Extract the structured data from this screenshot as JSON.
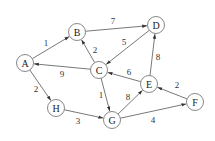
{
  "graph": {
    "nodes": [
      {
        "id": "A",
        "label": "A",
        "x": 25,
        "y": 63
      },
      {
        "id": "B",
        "label": "B",
        "x": 77,
        "y": 32
      },
      {
        "id": "C",
        "label": "C",
        "x": 99,
        "y": 70
      },
      {
        "id": "D",
        "label": "D",
        "x": 156,
        "y": 25
      },
      {
        "id": "E",
        "label": "E",
        "x": 149,
        "y": 84
      },
      {
        "id": "F",
        "label": "F",
        "x": 195,
        "y": 102
      },
      {
        "id": "G",
        "label": "G",
        "x": 112,
        "y": 120
      },
      {
        "id": "H",
        "label": "H",
        "x": 56,
        "y": 108
      }
    ],
    "edges": [
      {
        "from": "A",
        "to": "B",
        "weight": "1",
        "lx": 46,
        "ly": 43
      },
      {
        "from": "B",
        "to": "D",
        "weight": "7",
        "lx": 113,
        "ly": 21
      },
      {
        "from": "C",
        "to": "B",
        "weight": "2",
        "lx": 95,
        "ly": 50
      },
      {
        "from": "D",
        "to": "C",
        "weight": "5",
        "lx": 124,
        "ly": 42
      },
      {
        "from": "C",
        "to": "A",
        "weight": "9",
        "lx": 62,
        "ly": 74
      },
      {
        "from": "E",
        "to": "C",
        "weight": "6",
        "lx": 129,
        "ly": 72
      },
      {
        "from": "E",
        "to": "D",
        "weight": "8",
        "lx": 158,
        "ly": 57
      },
      {
        "from": "C",
        "to": "G",
        "weight": "1",
        "lx": 101,
        "ly": 95
      },
      {
        "from": "A",
        "to": "H",
        "weight": "2",
        "lx": 36,
        "ly": 89
      },
      {
        "from": "H",
        "to": "G",
        "weight": "3",
        "lx": 78,
        "ly": 121
      },
      {
        "from": "G",
        "to": "E",
        "weight": "8",
        "lx": 128,
        "ly": 97
      },
      {
        "from": "F",
        "to": "E",
        "weight": "2",
        "lx": 177,
        "ly": 85
      },
      {
        "from": "G",
        "to": "F",
        "weight": "4",
        "lx": 153,
        "ly": 120
      }
    ],
    "node_radius": 8.5,
    "colors": {
      "stroke": "#555555",
      "text": "#222222",
      "background": "#ffffff"
    }
  }
}
